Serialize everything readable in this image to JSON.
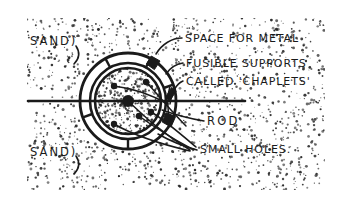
{
  "figure": {
    "background_color": "#ffffff",
    "ink_color": "#1a1a1a",
    "sand_stipple_color": "#2b2b2b"
  },
  "labels": {
    "sand_top": "SAND)",
    "sand_bottom": "SAND)",
    "space_for_metal": "SPACE FOR METAL",
    "fusible_supports": "FUSIBLE SUPPORTS",
    "called_chaplets": "CALLED 'CHAPLETS'",
    "rod": "ROD",
    "small_holes": "SMALL HOLES."
  },
  "geometry": {
    "center_x": 128,
    "center_y": 101,
    "outer_radius": 48,
    "mid_radius": 38,
    "inner_radius": 33,
    "rod_line_y": 101,
    "rod_line_x_start": 28,
    "rod_line_x_end": 245,
    "hub_radius": 6,
    "hole_radius": 3.2,
    "holes": [
      {
        "x": 114,
        "y": 86
      },
      {
        "x": 146,
        "y": 82
      },
      {
        "x": 151,
        "y": 112
      },
      {
        "x": 139,
        "y": 116
      },
      {
        "x": 114,
        "y": 124
      }
    ],
    "chaplet_angles_deg": [
      118,
      62,
      20,
      200,
      270,
      340
    ],
    "sand_field": {
      "x": 27,
      "y": 18,
      "width": 298,
      "height": 172
    }
  }
}
